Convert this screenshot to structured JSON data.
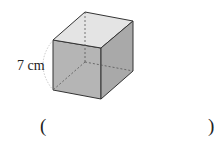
{
  "figure": {
    "shape": "cube",
    "edge_label": "7 cm"
  },
  "answer": {
    "open_paren": "(",
    "close_paren": ")",
    "value": ""
  }
}
